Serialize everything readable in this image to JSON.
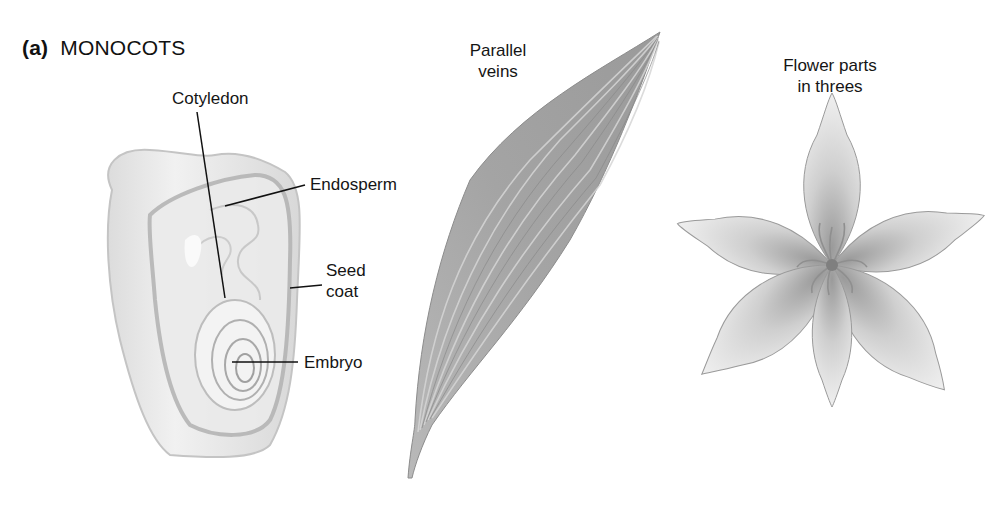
{
  "figure": {
    "part_label": "(a)",
    "title": "MONOCOTS"
  },
  "seed": {
    "labels": {
      "cotyledon": "Cotyledon",
      "endosperm": "Endosperm",
      "seed_coat_line1": "Seed",
      "seed_coat_line2": "coat",
      "embryo": "Embryo"
    }
  },
  "leaf": {
    "label_line1": "Parallel",
    "label_line2": "veins"
  },
  "flower": {
    "label_line1": "Flower parts",
    "label_line2": "in threes"
  },
  "colors": {
    "background": "#ffffff",
    "text": "#151515",
    "seed_fill": "#e4e4e4",
    "leaf_fill": "#a8a8a8",
    "flower_fill": "#d9d9d9"
  }
}
